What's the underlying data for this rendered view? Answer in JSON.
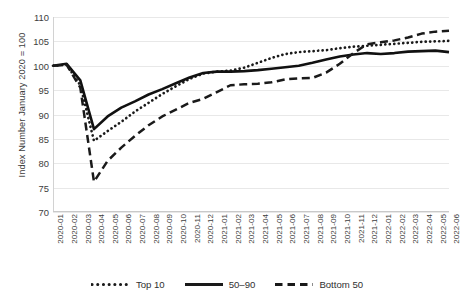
{
  "axes": {
    "y_title": "Index Number January 2020 = 100",
    "y_ticks": [
      "110",
      "105",
      "100",
      "95",
      "90",
      "85",
      "80",
      "75",
      "70"
    ],
    "x_ticks": [
      "2020-01",
      "2020-02",
      "2020-03",
      "2020-04",
      "2020-05",
      "2020-06",
      "2020-07",
      "2020-08",
      "2020-09",
      "2020-10",
      "2020-11",
      "2020-12",
      "2021-01",
      "2021-02",
      "2021-03",
      "2021-04",
      "2021-05",
      "2021-06",
      "2021-07",
      "2021-08",
      "2021-09",
      "2021-10",
      "2021-11",
      "2021-12",
      "2022-01",
      "2022-02",
      "2022-03",
      "2022-04",
      "2022-05",
      "2022-06"
    ]
  },
  "legend": {
    "items": [
      {
        "label": "Top 10",
        "style": "dotted",
        "color": "#1a1a1a"
      },
      {
        "label": "50–90",
        "style": "solid",
        "color": "#1a1a1a"
      },
      {
        "label": "Bottom 50",
        "style": "dashed",
        "color": "#1a1a1a"
      }
    ]
  },
  "chart_data": {
    "type": "line",
    "title": "",
    "xlabel": "",
    "ylabel": "Index Number January 2020 = 100",
    "ylim": [
      70,
      110
    ],
    "ytick_step": 5,
    "grid": true,
    "legend_position": "bottom",
    "x": [
      "2020-01",
      "2020-02",
      "2020-03",
      "2020-04",
      "2020-05",
      "2020-06",
      "2020-07",
      "2020-08",
      "2020-09",
      "2020-10",
      "2020-11",
      "2020-12",
      "2021-01",
      "2021-02",
      "2021-03",
      "2021-04",
      "2021-05",
      "2021-06",
      "2021-07",
      "2021-08",
      "2021-09",
      "2021-10",
      "2021-11",
      "2021-12",
      "2022-01",
      "2022-02",
      "2022-03",
      "2022-04",
      "2022-05",
      "2022-06"
    ],
    "series": [
      {
        "name": "Top 10",
        "style": "dotted",
        "color": "#1a1a1a",
        "values": [
          100.0,
          100.2,
          96.0,
          84.6,
          86.6,
          88.5,
          90.6,
          92.4,
          94.2,
          95.8,
          97.3,
          98.4,
          98.8,
          99.0,
          99.6,
          100.6,
          101.6,
          102.4,
          102.8,
          103.0,
          103.2,
          103.6,
          103.9,
          104.1,
          104.3,
          104.5,
          104.7,
          104.9,
          105.0,
          105.1
        ]
      },
      {
        "name": "50–90",
        "style": "solid",
        "color": "#111111",
        "values": [
          100.0,
          100.4,
          97.0,
          87.0,
          89.6,
          91.4,
          92.7,
          94.1,
          95.2,
          96.4,
          97.6,
          98.5,
          98.8,
          98.8,
          98.9,
          99.1,
          99.4,
          99.7,
          100.0,
          100.6,
          101.3,
          101.9,
          102.3,
          102.6,
          102.4,
          102.6,
          102.9,
          103.0,
          103.1,
          102.8
        ]
      },
      {
        "name": "Bottom 50",
        "style": "dashed",
        "color": "#1a1a1a",
        "values": [
          100.0,
          100.2,
          95.5,
          76.2,
          80.5,
          83.2,
          85.6,
          87.8,
          89.6,
          91.0,
          92.4,
          93.2,
          94.6,
          96.0,
          96.2,
          96.3,
          96.6,
          97.2,
          97.4,
          97.5,
          98.6,
          100.4,
          102.6,
          104.4,
          104.8,
          105.2,
          105.8,
          106.6,
          107.0,
          107.2
        ]
      }
    ]
  }
}
